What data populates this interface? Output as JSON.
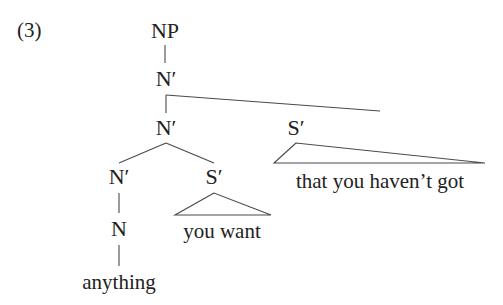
{
  "example_number": "(3)",
  "tree": {
    "root": {
      "label": "NP",
      "child": {
        "label": "N′",
        "children": [
          {
            "label": "N′",
            "children": [
              {
                "label": "N′",
                "child": {
                  "label": "N",
                  "child": {
                    "word": "anything"
                  }
                }
              },
              {
                "label": "S′",
                "triangle": "you want"
              }
            ]
          },
          {
            "label": "S′",
            "triangle": "that you haven’t got"
          }
        ]
      }
    }
  },
  "colors": {
    "text": "#222222",
    "lines": "#4a4a4a",
    "background": "#ffffff"
  }
}
